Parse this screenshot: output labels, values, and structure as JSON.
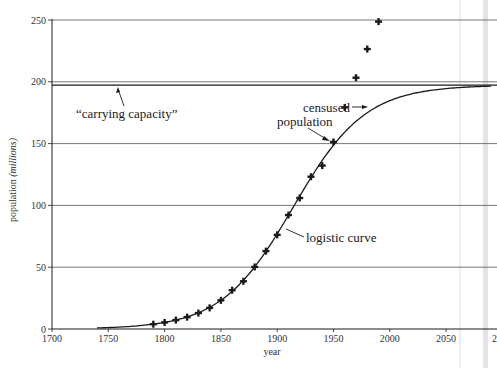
{
  "chart_data": {
    "type": "scatter",
    "title": "",
    "xlabel": "year",
    "ylabel": "population (millions)",
    "ylabel_plain": "population",
    "ylabel_italic": "(millions)",
    "xlim": [
      1700,
      2090
    ],
    "ylim": [
      0,
      250
    ],
    "x_ticks": [
      1700,
      1750,
      1800,
      1850,
      1900,
      1950,
      2000,
      2050
    ],
    "y_ticks": [
      0,
      50,
      100,
      150,
      200,
      250
    ],
    "grid": "horizontal",
    "legend": null,
    "series": [
      {
        "name": "censused population",
        "type": "scatter",
        "marker": "cross",
        "x": [
          1790,
          1800,
          1810,
          1820,
          1830,
          1840,
          1850,
          1860,
          1870,
          1880,
          1890,
          1900,
          1910,
          1920,
          1930,
          1940,
          1950,
          1960,
          1970,
          1980,
          1990
        ],
        "values": [
          3.9,
          5.3,
          7.2,
          9.6,
          12.9,
          17.1,
          23.2,
          31.4,
          38.6,
          50.2,
          63.0,
          76.2,
          92.2,
          106.0,
          123.2,
          132.2,
          151.3,
          179.3,
          203.3,
          226.5,
          248.7
        ]
      },
      {
        "name": "logistic curve",
        "type": "line",
        "formula": "197.27 / (1 + exp(-0.03134 * (year - 1914.25)))",
        "carrying_capacity": 197.27,
        "x_range": [
          1740,
          2090
        ]
      },
      {
        "name": "carrying capacity",
        "type": "hline",
        "value": 197.27
      }
    ],
    "annotations": [
      {
        "text": "“carrying capacity”",
        "points_to": "carrying capacity line"
      },
      {
        "text": "censused",
        "text2": "population",
        "points_to": [
          "1960 data point",
          "1950 data point"
        ]
      },
      {
        "text": "logistic curve",
        "points_to": "logistic curve near 1910"
      }
    ]
  },
  "labels": {
    "carrying_capacity": "“carrying capacity”",
    "censused_line1": "censused",
    "censused_line2": "population",
    "logistic": "logistic curve",
    "xlabel": "year",
    "ylabel_plain": "population ",
    "ylabel_italic": "(millions)"
  },
  "colors": {
    "ink": "#1a1a1a",
    "grid": "#555555",
    "background": "#ffffff"
  }
}
